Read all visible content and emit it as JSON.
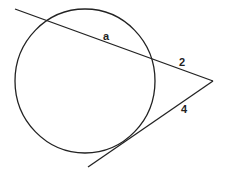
{
  "diagram": {
    "type": "circle-secant-tangent",
    "circle": {
      "cx": 85,
      "cy": 81,
      "rx": 70,
      "ry": 72
    },
    "external_point": {
      "x": 213,
      "y": 81
    },
    "secant": {
      "start": {
        "x": 15,
        "y": 9
      },
      "end": {
        "x": 213,
        "y": 81
      }
    },
    "tangent": {
      "start": {
        "x": 88,
        "y": 167
      },
      "end": {
        "x": 213,
        "y": 81
      }
    },
    "labels": {
      "chord_label": "a",
      "external_secant_label": "2",
      "tangent_label": "4"
    },
    "stroke_color": "#222222"
  }
}
